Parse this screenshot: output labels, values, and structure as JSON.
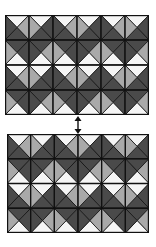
{
  "figure": {
    "colors": {
      "dark": "#4a4a4a",
      "gray": "#a9a9a9",
      "white": "#f5f5f5",
      "line": "#111111"
    },
    "grid": {
      "cols": 6,
      "rows": 4
    },
    "tile_types": {
      "A": {
        "top": "white",
        "left": "dark",
        "right": "gray",
        "bottom": "dark"
      },
      "B": {
        "top": "white",
        "left": "gray",
        "right": "dark",
        "bottom": "dark"
      },
      "C": {
        "top": "dark",
        "left": "gray",
        "right": "dark",
        "bottom": "white"
      },
      "D": {
        "top": "dark",
        "left": "dark",
        "right": "gray",
        "bottom": "white"
      }
    },
    "panels": [
      {
        "name": "top-panel",
        "x": 5,
        "y": 15,
        "width": 144,
        "height": 100,
        "rows": [
          [
            "A",
            "B",
            "A",
            "B",
            "A",
            "B"
          ],
          [
            "C",
            "D",
            "C",
            "D",
            "C",
            "D"
          ],
          [
            "A",
            "B",
            "A",
            "B",
            "A",
            "B"
          ],
          [
            "C",
            "D",
            "C",
            "D",
            "C",
            "D"
          ]
        ]
      },
      {
        "name": "bottom-panel",
        "x": 7,
        "y": 134,
        "width": 142,
        "height": 99,
        "rows": [
          [
            "A",
            "B",
            "A",
            "B",
            "A",
            "B"
          ],
          [
            "C",
            "D",
            "C",
            "D",
            "C",
            "D"
          ],
          [
            "A",
            "B",
            "A",
            "B",
            "A",
            "B"
          ],
          [
            "C",
            "D",
            "C",
            "D",
            "C",
            "D"
          ]
        ]
      }
    ],
    "connector": {
      "type": "double-headed-arrow",
      "orientation": "vertical"
    }
  }
}
